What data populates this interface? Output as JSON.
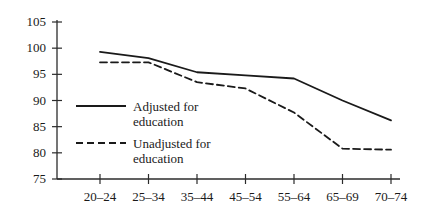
{
  "chart_data": {
    "type": "line",
    "title": "",
    "subtitle": "",
    "xlabel": "",
    "ylabel": "",
    "categories": [
      "20–24",
      "25–34",
      "35–44",
      "45–54",
      "55–64",
      "65–69",
      "70–74"
    ],
    "ylim": [
      75,
      105
    ],
    "y_ticks": [
      75,
      80,
      85,
      90,
      95,
      100,
      105
    ],
    "grid": false,
    "legend_position": "inside-left",
    "series": [
      {
        "name": "Adjusted for education",
        "style": "solid",
        "color": "#1a1a1a",
        "values": [
          99.3,
          98.1,
          95.4,
          94.8,
          94.2,
          90.0,
          86.2
        ]
      },
      {
        "name": "Unadjusted for education",
        "style": "dashed",
        "color": "#1a1a1a",
        "values": [
          97.3,
          97.3,
          93.5,
          92.3,
          87.7,
          80.8,
          80.6
        ]
      }
    ]
  },
  "axes": {
    "y_tick_labels": [
      "105",
      "100",
      "95",
      "90",
      "85",
      "80",
      "75"
    ],
    "x_tick_labels": [
      "20–24",
      "25–34",
      "35–44",
      "45–54",
      "55–64",
      "65–69",
      "70–74"
    ]
  },
  "legend": {
    "entries": [
      {
        "line1": "Adjusted for",
        "line2": "education",
        "style": "solid"
      },
      {
        "line1": "Unadjusted for",
        "line2": "education",
        "style": "dashed"
      }
    ]
  }
}
